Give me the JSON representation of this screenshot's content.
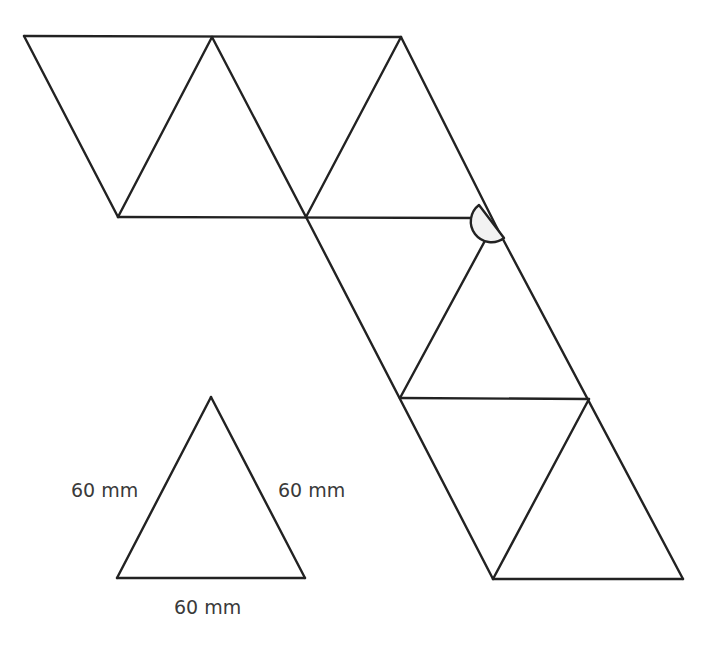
{
  "diagram": {
    "type": "triangle-net",
    "stroke_color": "#222222",
    "angle_marker_fill": "#f2f2f2",
    "net_triangles": 10,
    "reference_triangle": {
      "left_side_label": "60 mm",
      "right_side_label": "60 mm",
      "base_label": "60 mm"
    }
  }
}
